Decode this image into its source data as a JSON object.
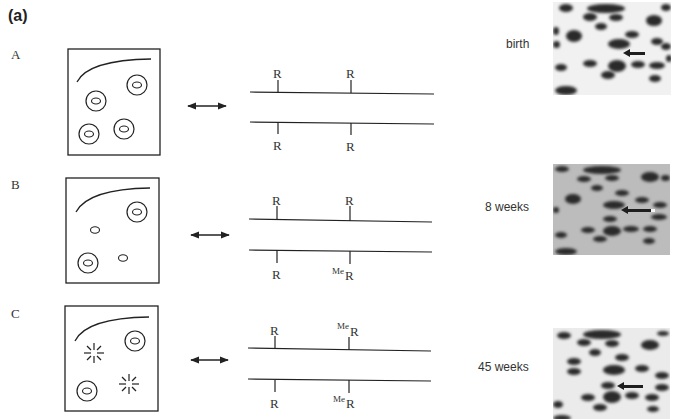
{
  "figure": {
    "panel_label": "(a)",
    "rows": [
      {
        "id": "A",
        "label": "A",
        "age": "birth",
        "cells": [
          "normal",
          "normal",
          "normal",
          "normal"
        ],
        "top_strand_sites": [
          "R",
          "R"
        ],
        "bottom_strand_sites": [
          "R",
          "R"
        ],
        "top_methylated": [
          false,
          false
        ],
        "bottom_methylated": [
          false,
          false
        ]
      },
      {
        "id": "B",
        "label": "B",
        "age": "8 weeks",
        "cells": [
          "normal",
          "small",
          "small",
          "normal"
        ],
        "top_strand_sites": [
          "R",
          "R"
        ],
        "bottom_strand_sites": [
          "R",
          "R"
        ],
        "top_methylated": [
          false,
          false
        ],
        "bottom_methylated": [
          false,
          true
        ]
      },
      {
        "id": "C",
        "label": "C",
        "age": "45 weeks",
        "cells": [
          "burst",
          "normal",
          "normal",
          "burst"
        ],
        "top_strand_sites": [
          "R",
          "R"
        ],
        "bottom_strand_sites": [
          "R",
          "R"
        ],
        "top_methylated": [
          false,
          true
        ],
        "bottom_methylated": [
          false,
          true
        ]
      }
    ],
    "methyl_prefix": "Me",
    "site_label": "R",
    "colors": {
      "line": "#222222",
      "text": "#333333",
      "gel_bg_birth": "#f2f2f2",
      "gel_bg_8w": "#bdbdbd",
      "gel_bg_45w": "#ededed",
      "spot": "#2a2a2a"
    }
  }
}
